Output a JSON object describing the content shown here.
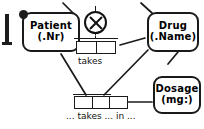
{
  "diagram": {
    "type": "orm-conceptual-schema",
    "background": "#ffffff",
    "line_color": "#1a1a1a"
  },
  "entities": [
    {
      "id": "patient",
      "name": "Patient",
      "reference_mode": "(.Nr)"
    },
    {
      "id": "drug",
      "name": "Drug",
      "reference_mode": "(.Name)"
    },
    {
      "id": "dosage",
      "name": "Dosage",
      "reference_mode": "(mg:)"
    }
  ],
  "fact_types": [
    {
      "id": "takes",
      "label": "takes",
      "roles": 2
    },
    {
      "id": "takes-in",
      "label": "... takes ... in ...",
      "roles": 3
    }
  ],
  "constraints": [
    {
      "id": "exclusion",
      "symbol": "⊗",
      "name": "exclusion-constraint"
    },
    {
      "id": "uniqueness-takes",
      "name": "uniqueness-bar"
    },
    {
      "id": "uniqueness-takes-in",
      "name": "uniqueness-bar"
    }
  ]
}
